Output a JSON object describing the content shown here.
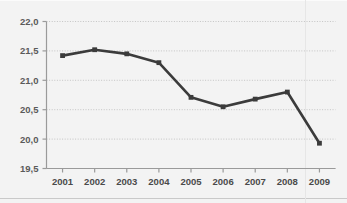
{
  "chart_data": {
    "type": "line",
    "title": "",
    "subtitle": "",
    "xlabel": "",
    "ylabel": "",
    "categories": [
      "2001",
      "2002",
      "2003",
      "2004",
      "2005",
      "2006",
      "2007",
      "2008",
      "2009"
    ],
    "x": [
      2001,
      2002,
      2003,
      2004,
      2005,
      2006,
      2007,
      2008,
      2009
    ],
    "series": [
      {
        "name": "",
        "values": [
          21.42,
          21.52,
          21.45,
          21.3,
          20.71,
          20.55,
          20.68,
          20.8,
          19.93
        ]
      }
    ],
    "ylim": [
      19.5,
      22.0
    ],
    "ytick_values": [
      19.5,
      20.0,
      20.5,
      21.0,
      21.5,
      22.0
    ],
    "ytick_labels": [
      "19,5",
      "20,0",
      "20,5",
      "21,0",
      "21,5",
      "22,0"
    ],
    "xtick_labels": [
      "2001",
      "2002",
      "2003",
      "2004",
      "2005",
      "2006",
      "2007",
      "2008",
      "2009"
    ],
    "grid": true,
    "grid_axis": "y",
    "grid_style": "dotted",
    "legend": false,
    "legend_position": "none",
    "marker": "square",
    "decimal_separator": ",",
    "colors": {
      "line": "#3b3b3b",
      "marker": "#3b3b3b",
      "grid": "#c4c4c4",
      "axis": "#9a9a9a",
      "tick_label": "#555555",
      "background": "#f3f3f3",
      "frame": "#c9c9c9"
    }
  }
}
